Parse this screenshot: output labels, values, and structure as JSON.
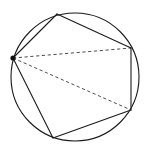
{
  "figure": {
    "name": "inscribed-pentagon-with-diagonals",
    "background_color": "#ffffff",
    "canvas": {
      "width": 147,
      "height": 153
    },
    "circle": {
      "name": "circumcircle",
      "cx": 75,
      "cy": 77,
      "r": 64,
      "stroke": "#1a1a1a",
      "stroke_width": 1.1,
      "fill": "none"
    },
    "vertices": [
      {
        "label": "A",
        "name": "vertex-left-marked",
        "x": 13,
        "y": 58,
        "marked": true
      },
      {
        "label": "B",
        "name": "vertex-top",
        "x": 57,
        "y": 14,
        "marked": false
      },
      {
        "label": "C",
        "name": "vertex-right-upper",
        "x": 131,
        "y": 48,
        "marked": false
      },
      {
        "label": "D",
        "name": "vertex-right-lower",
        "x": 131,
        "y": 110,
        "marked": false
      },
      {
        "label": "E",
        "name": "vertex-bottom",
        "x": 53,
        "y": 138,
        "marked": false
      }
    ],
    "vertex_marker": {
      "name": "vertex-dot",
      "radius": 2.6,
      "fill": "#111111"
    },
    "polygon_edges": [
      {
        "name": "edge-A-B",
        "from": "A",
        "to": "B",
        "style": "solid"
      },
      {
        "name": "edge-B-C",
        "from": "B",
        "to": "C",
        "style": "solid"
      },
      {
        "name": "edge-C-D",
        "from": "C",
        "to": "D",
        "style": "solid"
      },
      {
        "name": "edge-D-E",
        "from": "D",
        "to": "E",
        "style": "solid"
      },
      {
        "name": "edge-E-A",
        "from": "E",
        "to": "A",
        "style": "solid"
      }
    ],
    "diagonals": [
      {
        "name": "diagonal-A-C",
        "from": "A",
        "to": "C",
        "style": "dashed"
      },
      {
        "name": "diagonal-A-D",
        "from": "A",
        "to": "D",
        "style": "dashed"
      }
    ],
    "edge_style": {
      "stroke": "#1a1a1a",
      "stroke_width": 1.1
    },
    "diagonal_style": {
      "stroke": "#4d4d4d",
      "stroke_width": 1.0,
      "dash_array": "3.2,2.6"
    },
    "path_data": {
      "polygon": "M 13 58 L 57 14 L 131 48 L 131 110 L 53 138 Z",
      "diagonal_ac": "M 13 58 L 131 48",
      "diagonal_ad": "M 13 58 L 131 110"
    }
  }
}
